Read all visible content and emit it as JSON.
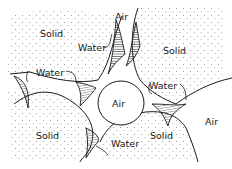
{
  "diagram": {
    "title": "",
    "colors": {
      "background": "#ffffff",
      "outline": "#1a1a1a",
      "stipple": "#8a8a8a",
      "hatch": "#333333"
    },
    "labels": {
      "solid_top_left": "Solid",
      "solid_top_right": "Solid",
      "solid_bottom_left": "Solid",
      "solid_bottom_right": "Solid",
      "air_top": "Air",
      "air_center": "Air",
      "air_right": "Air",
      "water_top": "Water",
      "water_left": "Water",
      "water_right": "Water",
      "water_bottom": "Water"
    }
  }
}
